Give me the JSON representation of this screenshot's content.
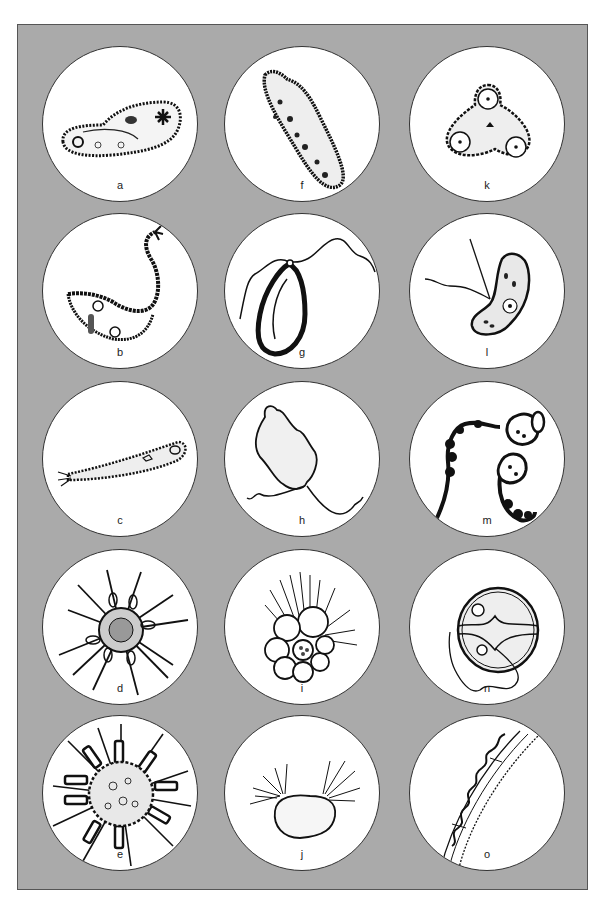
{
  "figure": {
    "background_color": "#aaaaaa",
    "circle_fill": "#ffffff",
    "columns": 3,
    "rows": 5,
    "panels": [
      {
        "label": "a",
        "icon": "paramecium-ciliate-icon"
      },
      {
        "label": "b",
        "icon": "lacrymaria-swan-ciliate-icon"
      },
      {
        "label": "c",
        "icon": "elongated-ciliate-icon"
      },
      {
        "label": "d",
        "icon": "radiolarian-spined-icon"
      },
      {
        "label": "e",
        "icon": "heliozoan-radiating-icon"
      },
      {
        "label": "f",
        "icon": "oblong-ciliate-icon"
      },
      {
        "label": "g",
        "icon": "flagellate-leaf-shaped-icon"
      },
      {
        "label": "h",
        "icon": "irregular-flagellate-icon"
      },
      {
        "label": "i",
        "icon": "foraminiferan-chambered-icon"
      },
      {
        "label": "j",
        "icon": "tufted-protist-icon"
      },
      {
        "label": "k",
        "icon": "triangular-cell-icon"
      },
      {
        "label": "l",
        "icon": "biflagellate-kidney-icon"
      },
      {
        "label": "m",
        "icon": "colonial-chain-icon"
      },
      {
        "label": "n",
        "icon": "dinoflagellate-icon"
      },
      {
        "label": "o",
        "icon": "spiral-filament-icon"
      }
    ]
  }
}
